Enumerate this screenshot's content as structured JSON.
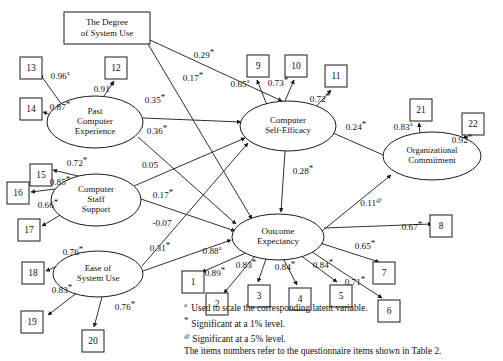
{
  "figure": {
    "type": "path-diagram"
  },
  "nodes": {
    "boxes": [
      {
        "id": "degree-of-system-use",
        "label_line1": "The Degree",
        "label_line2": "of System Use",
        "x": 64,
        "y": 12,
        "w": 86,
        "h": 32
      },
      {
        "id": "item-13",
        "label": "13",
        "x": 20,
        "y": 57,
        "w": 22,
        "h": 22
      },
      {
        "id": "item-12",
        "label": "12",
        "x": 105,
        "y": 57,
        "w": 22,
        "h": 22
      },
      {
        "id": "item-14",
        "label": "14",
        "x": 20,
        "y": 98,
        "w": 22,
        "h": 22
      },
      {
        "id": "item-15",
        "label": "15",
        "x": 30,
        "y": 164,
        "w": 22,
        "h": 22
      },
      {
        "id": "item-16",
        "label": "16",
        "x": 7,
        "y": 182,
        "w": 22,
        "h": 22
      },
      {
        "id": "item-17",
        "label": "17",
        "x": 18,
        "y": 219,
        "w": 22,
        "h": 22
      },
      {
        "id": "item-18",
        "label": "18",
        "x": 22,
        "y": 262,
        "w": 22,
        "h": 22
      },
      {
        "id": "item-19",
        "label": "19",
        "x": 21,
        "y": 311,
        "w": 22,
        "h": 22
      },
      {
        "id": "item-20",
        "label": "20",
        "x": 82,
        "y": 330,
        "w": 22,
        "h": 22
      },
      {
        "id": "item-9",
        "label": "9",
        "x": 247,
        "y": 55,
        "w": 22,
        "h": 22
      },
      {
        "id": "item-10",
        "label": "10",
        "x": 285,
        "y": 55,
        "w": 22,
        "h": 22
      },
      {
        "id": "item-11",
        "label": "11",
        "x": 325,
        "y": 65,
        "w": 22,
        "h": 22
      },
      {
        "id": "item-21",
        "label": "21",
        "x": 410,
        "y": 99,
        "w": 22,
        "h": 22
      },
      {
        "id": "item-22",
        "label": "22",
        "x": 462,
        "y": 113,
        "w": 22,
        "h": 22
      },
      {
        "id": "item-1",
        "label": "1",
        "x": 182,
        "y": 271,
        "w": 22,
        "h": 22
      },
      {
        "id": "item-2",
        "label": "2",
        "x": 206,
        "y": 293,
        "w": 22,
        "h": 22
      },
      {
        "id": "item-3",
        "label": "3",
        "x": 248,
        "y": 285,
        "w": 22,
        "h": 22
      },
      {
        "id": "item-4",
        "label": "4",
        "x": 289,
        "y": 288,
        "w": 22,
        "h": 22
      },
      {
        "id": "item-5",
        "label": "5",
        "x": 330,
        "y": 285,
        "w": 22,
        "h": 22
      },
      {
        "id": "item-7",
        "label": "7",
        "x": 373,
        "y": 262,
        "w": 22,
        "h": 22
      },
      {
        "id": "item-6",
        "label": "6",
        "x": 378,
        "y": 300,
        "w": 22,
        "h": 22
      },
      {
        "id": "item-8",
        "label": "8",
        "x": 430,
        "y": 215,
        "w": 22,
        "h": 22
      }
    ],
    "ellipses": [
      {
        "id": "past-computer-experience",
        "lines": [
          "Past",
          "Computer",
          "Experience"
        ],
        "cx": 95,
        "cy": 122,
        "rx": 48,
        "ry": 26
      },
      {
        "id": "computer-staff-support",
        "lines": [
          "Computer",
          "Staff",
          "Support"
        ],
        "cx": 96,
        "cy": 200,
        "rx": 45,
        "ry": 26
      },
      {
        "id": "ease-of-system-use",
        "lines": [
          "Ease of",
          "System Use"
        ],
        "cx": 98,
        "cy": 274,
        "rx": 45,
        "ry": 23
      },
      {
        "id": "computer-self-efficacy",
        "lines": [
          "Computer",
          "Self-Efficacy"
        ],
        "cx": 288,
        "cy": 126,
        "rx": 48,
        "ry": 25
      },
      {
        "id": "outcome-expectancy",
        "lines": [
          "Outcome",
          "Expectancy"
        ],
        "cx": 278,
        "cy": 237,
        "rx": 46,
        "ry": 23
      },
      {
        "id": "organizational-commitment",
        "lines": [
          "Organizational",
          "Commitment"
        ],
        "cx": 432,
        "cy": 156,
        "rx": 49,
        "ry": 24
      }
    ]
  },
  "coefficients": [
    {
      "id": "degree-to-self-efficacy",
      "value": "0.29",
      "mark": "*",
      "x": 204,
      "y": 56
    },
    {
      "id": "degree-to-outcome",
      "value": "0.17",
      "mark": "*",
      "x": 193,
      "y": 79
    },
    {
      "id": "past-exp-to-item13",
      "value": "0.96",
      "mark": "a",
      "x": 60,
      "y": 77
    },
    {
      "id": "past-exp-to-item12",
      "value": "0.91",
      "mark": "*",
      "x": 104,
      "y": 90
    },
    {
      "id": "past-exp-to-item14",
      "value": "0.87",
      "mark": "*",
      "x": 60,
      "y": 108
    },
    {
      "id": "past-exp-to-self-efficacy",
      "value": "0.35",
      "mark": "*",
      "x": 155,
      "y": 101
    },
    {
      "id": "past-exp-to-outcome",
      "value": "0.36",
      "mark": "*",
      "x": 157,
      "y": 132
    },
    {
      "id": "staff-support-to-item15",
      "value": "0.72",
      "mark": "*",
      "x": 77,
      "y": 164
    },
    {
      "id": "staff-support-to-item16",
      "value": "0.85",
      "mark": "*",
      "x": 60,
      "y": 183
    },
    {
      "id": "staff-support-to-item17",
      "value": "0.66",
      "mark": "*",
      "x": 48,
      "y": 206
    },
    {
      "id": "staff-support-to-self-efficacy",
      "value": "0.05",
      "mark": "",
      "x": 150,
      "y": 166
    },
    {
      "id": "staff-support-to-outcome",
      "value": "0.17",
      "mark": "*",
      "x": 163,
      "y": 196
    },
    {
      "id": "ease-to-self-efficacy",
      "value": "-0.07",
      "mark": "",
      "x": 162,
      "y": 224
    },
    {
      "id": "ease-to-outcome",
      "value": "0.31",
      "mark": "*",
      "x": 160,
      "y": 249
    },
    {
      "id": "ease-to-item18",
      "value": "0.76",
      "mark": "*",
      "x": 73,
      "y": 253
    },
    {
      "id": "ease-to-item19",
      "value": "0.83",
      "mark": "*",
      "x": 62,
      "y": 291
    },
    {
      "id": "ease-to-item20",
      "value": "0.76",
      "mark": "*",
      "x": 125,
      "y": 308
    },
    {
      "id": "self-efficacy-to-item9",
      "value": "0.65",
      "mark": "a",
      "x": 240,
      "y": 85
    },
    {
      "id": "self-efficacy-to-item10",
      "value": "0.73",
      "mark": "*",
      "x": 278,
      "y": 84
    },
    {
      "id": "self-efficacy-to-item11",
      "value": "0.72",
      "mark": "*",
      "x": 320,
      "y": 100
    },
    {
      "id": "self-efficacy-to-org-commit",
      "value": "0.24",
      "mark": "*",
      "x": 356,
      "y": 128
    },
    {
      "id": "self-efficacy-to-outcome",
      "value": "0.28",
      "mark": "*",
      "x": 303,
      "y": 172
    },
    {
      "id": "org-commit-to-item21",
      "value": "0.83",
      "mark": "a",
      "x": 403,
      "y": 128
    },
    {
      "id": "org-commit-to-item22",
      "value": "0.92",
      "mark": "*",
      "x": 462,
      "y": 141
    },
    {
      "id": "outcome-to-org-commit",
      "value": "0.11",
      "mark": "@",
      "x": 371,
      "y": 204
    },
    {
      "id": "outcome-to-item1",
      "value": "0.88",
      "mark": "a",
      "x": 212,
      "y": 252
    },
    {
      "id": "outcome-to-item2",
      "value": "0.89",
      "mark": "*",
      "x": 215,
      "y": 274
    },
    {
      "id": "outcome-to-item3",
      "value": "0.83",
      "mark": "*",
      "x": 246,
      "y": 266
    },
    {
      "id": "outcome-to-item4",
      "value": "0.84",
      "mark": "*",
      "x": 285,
      "y": 268
    },
    {
      "id": "outcome-to-item5",
      "value": "0.84",
      "mark": "*",
      "x": 323,
      "y": 266
    },
    {
      "id": "outcome-to-item7",
      "value": "0.65",
      "mark": "*",
      "x": 365,
      "y": 247
    },
    {
      "id": "outcome-to-item6",
      "value": "0.71",
      "mark": "*",
      "x": 355,
      "y": 283
    },
    {
      "id": "outcome-to-item8",
      "value": "0.67",
      "mark": "*",
      "x": 412,
      "y": 228
    }
  ],
  "legend": {
    "lines": [
      {
        "mark": "a",
        "mark_type": "sup",
        "text": "Used to scale the corresponding latent variable."
      },
      {
        "mark": "*",
        "mark_type": "ast",
        "text": "Significant at a 1% level."
      },
      {
        "mark": "@",
        "mark_type": "at",
        "text": "Significant at a 5% level."
      },
      {
        "mark": "",
        "mark_type": "none",
        "text": "The items numbers refer to the questionnaire items shown in Table 2."
      }
    ]
  }
}
